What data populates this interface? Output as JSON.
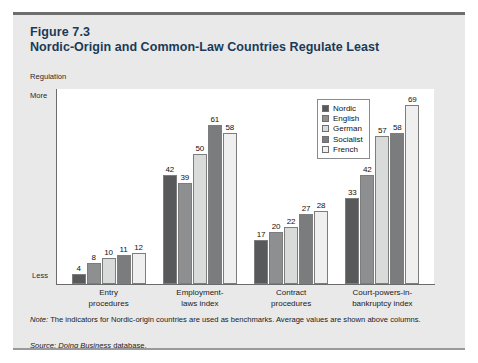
{
  "figure": {
    "number": "Figure 7.3",
    "title": "Nordic-Origin and Common-Law Countries Regulate Least"
  },
  "axis": {
    "unit_label": "Regulation",
    "top_label": "More",
    "bottom_label": "Less"
  },
  "note": {
    "lead": "Note:",
    "text": " The indicators for Nordic-origin countries are used as benchmarks. Average values are shown above columns."
  },
  "source": {
    "lead": "Source:",
    "publication": " Doing Business",
    "tail": " database."
  },
  "legend": {
    "position": "inside-top-right",
    "entries": [
      {
        "label": "Nordic",
        "color": "#58595b"
      },
      {
        "label": "English",
        "color": "#8d8f91"
      },
      {
        "label": "German",
        "color": "#d9dada"
      },
      {
        "label": "Socialist",
        "color": "#7a7c7e"
      },
      {
        "label": "French",
        "color": "#efefef"
      }
    ]
  },
  "chart_data": {
    "type": "bar",
    "title": "Nordic-Origin and Common-Law Countries Regulate Least",
    "xlabel": "",
    "ylabel": "Regulation",
    "ylim": [
      0,
      75
    ],
    "grid": false,
    "legend_position": "inside-top-right",
    "categories": [
      "Entry procedures",
      "Employment-laws index",
      "Contract procedures",
      "Court-powers-in-bankruptcy index"
    ],
    "category_lines": [
      [
        "Entry",
        "procedures"
      ],
      [
        "Employment-",
        "laws index"
      ],
      [
        "Contract",
        "procedures"
      ],
      [
        "Court-powers-in-",
        "bankruptcy index"
      ]
    ],
    "series": [
      {
        "name": "Nordic",
        "color": "#58595b",
        "values": [
          4,
          42,
          17,
          33
        ]
      },
      {
        "name": "English",
        "color": "#8d8f91",
        "values": [
          8,
          39,
          20,
          42
        ]
      },
      {
        "name": "German",
        "color": "#d9dada",
        "values": [
          10,
          50,
          22,
          57
        ]
      },
      {
        "name": "Socialist",
        "color": "#7a7c7e",
        "values": [
          11,
          61,
          27,
          58
        ]
      },
      {
        "name": "French",
        "color": "#efefef",
        "values": [
          12,
          58,
          28,
          69
        ]
      }
    ]
  }
}
